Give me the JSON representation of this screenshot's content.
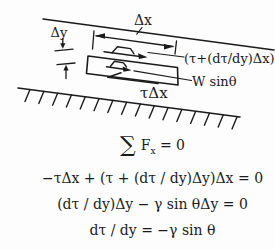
{
  "figure": {
    "background": "#fdfdfd",
    "ink": "#1b1b1b"
  },
  "diagram": {
    "dx_label": "Δx",
    "dy_label": "Δy",
    "top_shear_label": "(τ+(dτ/dy)Δx)",
    "weight_label": "W sinθ",
    "bottom_shear_label": "τΔx"
  },
  "equations": {
    "sum": {
      "sigma": "∑",
      "pre": "F",
      "sub": "x",
      "post": " = 0"
    },
    "line2": "−τΔx + (τ + (dτ / dy)Δy)Δx = 0",
    "line3": "(dτ / dy)Δy − γ sin θΔy = 0",
    "line4": "dτ / dy = −γ sin θ"
  }
}
